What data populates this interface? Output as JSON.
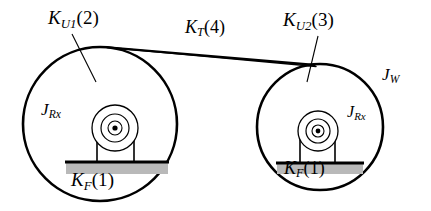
{
  "figure": {
    "type": "mechanical-schematic",
    "background_color": "#ffffff",
    "line_color": "#000000",
    "foundation_color": "#b9b9b9"
  },
  "labels": {
    "left_wheel_stiffness": {
      "symbol": "K",
      "subscript": "U1",
      "index": "(2)"
    },
    "belt_stiffness": {
      "symbol": "K",
      "subscript": "T",
      "index": "(4)"
    },
    "right_wheel_stiffness": {
      "symbol": "K",
      "subscript": "U2",
      "index": "(3)"
    },
    "wheel_inertia": {
      "symbol": "J",
      "subscript": "W",
      "index": ""
    },
    "left_rotor_inertia": {
      "symbol": "J",
      "subscript": "Rx",
      "index": ""
    },
    "right_rotor_inertia": {
      "symbol": "J",
      "subscript": "Rx",
      "index": ""
    },
    "left_foundation_stiffness": {
      "symbol": "K",
      "subscript": "F",
      "index": "(1)"
    },
    "right_foundation_stiffness": {
      "symbol": "K",
      "subscript": "F",
      "index": "(1)"
    }
  },
  "components": {
    "left_wheel": {
      "name": "left-wheel",
      "cx": 100,
      "cy": 124,
      "r": 77
    },
    "right_wheel": {
      "name": "right-wheel",
      "cx": 320,
      "cy": 127,
      "r": 63
    },
    "left_bearing": {
      "cx": 115,
      "cy": 128,
      "outer_r": 23,
      "mid_r": 14,
      "inner_r": 7,
      "dot_r": 2.6
    },
    "right_bearing": {
      "cx": 318,
      "cy": 131,
      "outer_r": 20,
      "mid_r": 12,
      "inner_r": 6,
      "dot_r": 2.4
    },
    "left_foundation": {
      "x": 66,
      "y": 163,
      "width": 102,
      "height": 11
    },
    "right_foundation": {
      "x": 277,
      "y": 164,
      "width": 86,
      "height": 10
    }
  }
}
